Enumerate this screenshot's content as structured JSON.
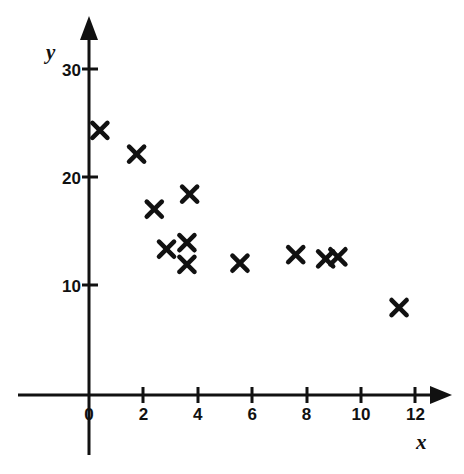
{
  "chart_data": {
    "type": "scatter",
    "title": "",
    "subtitle": "",
    "xlabel": "x",
    "ylabel": "y",
    "xlim": [
      0,
      12.8
    ],
    "ylim": [
      0,
      31.5
    ],
    "xticks": [
      0,
      2,
      4,
      6,
      8,
      10,
      12
    ],
    "xtick_labels": [
      "0",
      "2",
      "4",
      "6",
      "8",
      "10",
      "12"
    ],
    "yticks": [
      10,
      20,
      30
    ],
    "ytick_labels": [
      "10",
      "20",
      "30"
    ],
    "grid": false,
    "legend": null,
    "marker": "x-cross",
    "marker_color": "#111111",
    "axis_color": "#111111",
    "background_color": "#ffffff",
    "n_points": 12,
    "points": [
      {
        "x": 0.4,
        "y": 24.5
      },
      {
        "x": 1.75,
        "y": 22.3
      },
      {
        "x": 2.4,
        "y": 17.2
      },
      {
        "x": 3.7,
        "y": 18.6
      },
      {
        "x": 2.85,
        "y": 13.5
      },
      {
        "x": 3.6,
        "y": 14.1
      },
      {
        "x": 3.6,
        "y": 12.1
      },
      {
        "x": 5.55,
        "y": 12.2
      },
      {
        "x": 7.6,
        "y": 13.0
      },
      {
        "x": 8.7,
        "y": 12.6
      },
      {
        "x": 9.15,
        "y": 12.8
      },
      {
        "x": 11.4,
        "y": 8.1
      }
    ],
    "series": [
      {
        "name": "data",
        "x": [
          0.4,
          1.75,
          2.4,
          3.7,
          2.85,
          3.6,
          3.6,
          5.55,
          7.6,
          8.7,
          9.15,
          11.4
        ],
        "y": [
          24.5,
          22.3,
          17.2,
          18.6,
          13.5,
          14.1,
          12.1,
          12.2,
          13.0,
          12.6,
          12.8,
          8.1
        ]
      }
    ]
  },
  "axes": {
    "y_axis_name": "y",
    "x_axis_name": "x"
  }
}
